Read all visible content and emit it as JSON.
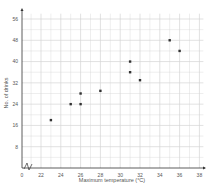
{
  "chart_data": {
    "type": "scatter",
    "title": "",
    "xlabel": "Maximum temperature (°C)",
    "ylabel": "No. of drinks",
    "xlim": [
      0,
      38
    ],
    "ylim": [
      0,
      56
    ],
    "x_axis_break": true,
    "x_ticks": [
      0,
      22,
      24,
      26,
      28,
      30,
      32,
      34,
      36,
      38
    ],
    "y_ticks": [
      8,
      16,
      24,
      32,
      40,
      48,
      56
    ],
    "grid": true,
    "points": [
      {
        "x": 23,
        "y": 18
      },
      {
        "x": 25,
        "y": 24
      },
      {
        "x": 26,
        "y": 24
      },
      {
        "x": 26,
        "y": 28
      },
      {
        "x": 28,
        "y": 29
      },
      {
        "x": 31,
        "y": 40
      },
      {
        "x": 31,
        "y": 36
      },
      {
        "x": 32,
        "y": 33
      },
      {
        "x": 35,
        "y": 48
      },
      {
        "x": 36,
        "y": 44
      }
    ]
  },
  "style": {
    "grid_color": "#d4d4d4",
    "axis_color": "#333333",
    "point_color": "#333333"
  }
}
